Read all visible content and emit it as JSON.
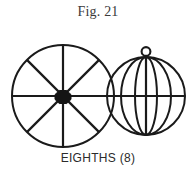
{
  "figure": {
    "title": "Fig. 21",
    "caption": "EIGHTHS (8)",
    "background_color": "#ffffff",
    "line_color": "#1a1a1a",
    "title_color": "#3a3a3a",
    "caption_color": "#2b2b2b"
  },
  "diagram": {
    "division_count": 8,
    "division_name": "EIGHTHS",
    "shapes": [
      {
        "name": "spoked-wheel",
        "type": "circle-with-spokes",
        "center_x": 63,
        "center_y": 72,
        "radius": 51,
        "spoke_count": 8,
        "hub": "filled-octagon"
      },
      {
        "name": "segmented-sphere",
        "type": "sphere-with-meridians",
        "center_x": 146,
        "center_y": 72,
        "radius": 39,
        "meridian_count": 8,
        "equator": true,
        "top_ring": true
      }
    ]
  }
}
